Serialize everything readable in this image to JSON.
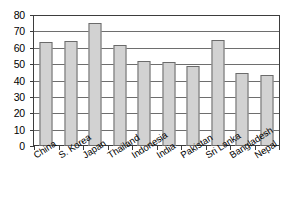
{
  "chart_data": {
    "type": "bar",
    "title": "",
    "subtitle": "",
    "xlabel": "",
    "ylabel": "",
    "ylim": [
      0,
      80
    ],
    "ytick_step": 10,
    "yticks": [
      "80",
      "70",
      "60",
      "50",
      "40",
      "30",
      "20",
      "10",
      "0"
    ],
    "grid": true,
    "legend": false,
    "legend_position": "none",
    "categories": [
      "China",
      "S. Korea",
      "Japan",
      "Thailand",
      "Indonesia",
      "India",
      "Pakistan",
      "Sri Lanka",
      "Bangladesh",
      "Nepal"
    ],
    "values": [
      64.0,
      64.5,
      76.0,
      62.3,
      52.5,
      51.5,
      49.5,
      65.3,
      44.7,
      43.5
    ],
    "series": [
      {
        "name": "",
        "values": [
          64.0,
          64.5,
          76.0,
          62.3,
          52.5,
          51.5,
          49.5,
          65.3,
          44.7,
          43.5
        ]
      }
    ],
    "annotations": []
  },
  "style": {
    "bar_fill": "#d2d2d2",
    "bar_border": "#6b6b6b",
    "grid_color": "#6e6e6e",
    "axis_color": "#3d3d3d",
    "text_color": "#000000",
    "background": "#ffffff"
  }
}
